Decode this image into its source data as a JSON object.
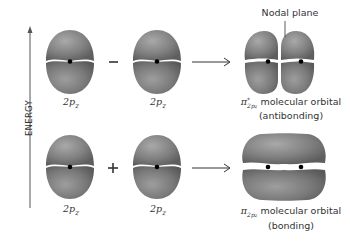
{
  "axis": {
    "label": "ENERGY",
    "direction": "up"
  },
  "top_row": {
    "left_orbital": {
      "label_main": "2p",
      "label_sub": "z"
    },
    "operator": "−",
    "right_orbital": {
      "label_main": "2p",
      "label_sub": "z"
    },
    "arrow": "→",
    "result": {
      "annotation": "Nodal plane",
      "symbol": "π",
      "superscript": "*",
      "subscript": "2p",
      "subscript_sub": "z",
      "label": "molecular orbital",
      "type": "(antibonding)"
    }
  },
  "bottom_row": {
    "left_orbital": {
      "label_main": "2p",
      "label_sub": "z"
    },
    "operator": "+",
    "right_orbital": {
      "label_main": "2p",
      "label_sub": "z"
    },
    "arrow": "→",
    "result": {
      "symbol": "π",
      "subscript": "2p",
      "subscript_sub": "z",
      "label": "molecular orbital",
      "type": "(bonding)"
    }
  },
  "colors": {
    "lobe": "#7a7a7a",
    "lobe_highlight": "#a8a8a8",
    "nucleus": "#000000",
    "line": "#333333"
  }
}
